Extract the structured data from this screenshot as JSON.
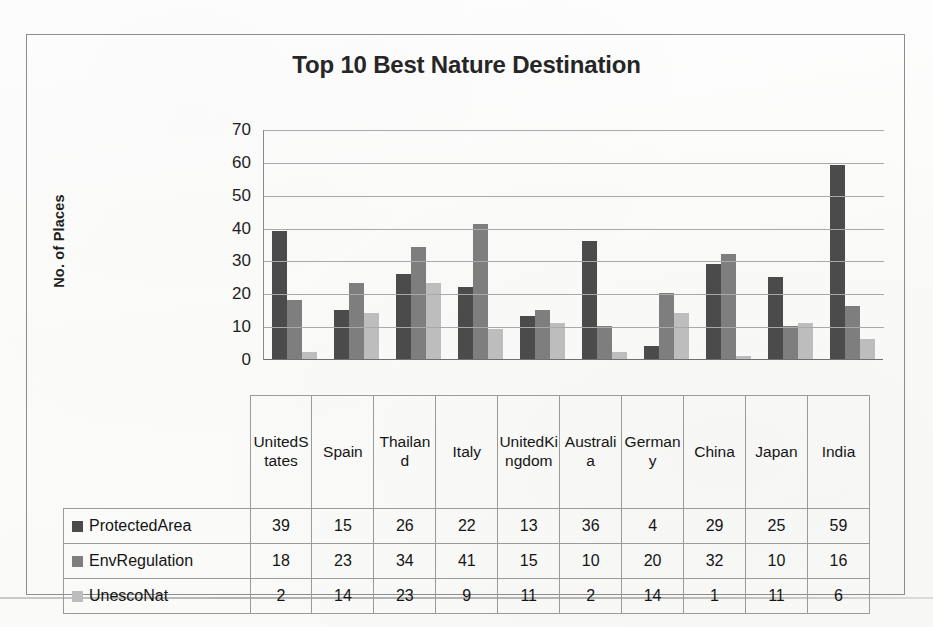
{
  "chart_data": {
    "type": "bar",
    "title": "Top 10 Best Nature Destination",
    "xlabel": "",
    "ylabel": "No. of Places",
    "ylim": [
      0,
      70
    ],
    "yticks": [
      0,
      10,
      20,
      30,
      40,
      50,
      60,
      70
    ],
    "grid": true,
    "legend_position": "table-left",
    "categories": [
      "United States",
      "Spain",
      "Thailand",
      "Italy",
      "United Kingdom",
      "Australia",
      "Germany",
      "China",
      "Japan",
      "India"
    ],
    "category_labels_wrapped": [
      "Unite d States",
      "Spain",
      "Thaila nd",
      "Italy",
      "Unite d Kingd om",
      "Austr alia",
      "Germ any",
      "China",
      "Japan",
      "India"
    ],
    "series": [
      {
        "name": "ProtectedArea",
        "color": "#4b4b4b",
        "values": [
          39,
          15,
          26,
          22,
          13,
          36,
          4,
          29,
          25,
          59
        ]
      },
      {
        "name": "EnvRegulation",
        "color": "#7e7e7e",
        "values": [
          18,
          23,
          34,
          41,
          15,
          10,
          20,
          32,
          10,
          16
        ]
      },
      {
        "name": "UnescoNat",
        "color": "#bdbdbd",
        "values": [
          2,
          14,
          23,
          9,
          11,
          2,
          14,
          1,
          11,
          6
        ]
      }
    ]
  }
}
